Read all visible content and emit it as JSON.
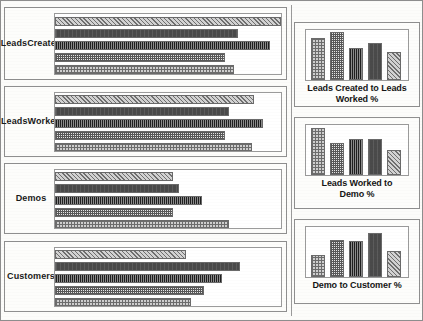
{
  "chart_data": [
    {
      "type": "bar",
      "orientation": "horizontal",
      "title": "Leads Created",
      "categories": [
        "Series 1",
        "Series 2",
        "Series 3",
        "Series 4",
        "Series 5"
      ],
      "values": [
        100,
        81,
        95,
        75,
        79
      ],
      "xlim": [
        0,
        100
      ],
      "grid": false,
      "legend": "none",
      "patterns": [
        "diagonal-hatch",
        "dark-solid",
        "vertical-pinstripe",
        "fine-checker",
        "coarse-checker"
      ]
    },
    {
      "type": "bar",
      "orientation": "horizontal",
      "title": "Leads Worked",
      "categories": [
        "Series 1",
        "Series 2",
        "Series 3",
        "Series 4",
        "Series 5"
      ],
      "values": [
        88,
        77,
        92,
        75,
        87
      ],
      "xlim": [
        0,
        100
      ],
      "grid": false,
      "legend": "none",
      "patterns": [
        "diagonal-hatch",
        "dark-solid",
        "vertical-pinstripe",
        "fine-checker",
        "coarse-checker"
      ]
    },
    {
      "type": "bar",
      "orientation": "horizontal",
      "title": "Demos",
      "categories": [
        "Series 1",
        "Series 2",
        "Series 3",
        "Series 4",
        "Series 5"
      ],
      "values": [
        52,
        55,
        65,
        52,
        77
      ],
      "xlim": [
        0,
        100
      ],
      "grid": false,
      "legend": "none",
      "patterns": [
        "diagonal-hatch",
        "dark-solid",
        "vertical-pinstripe",
        "fine-checker",
        "coarse-checker"
      ]
    },
    {
      "type": "bar",
      "orientation": "horizontal",
      "title": "Customers",
      "categories": [
        "Series 1",
        "Series 2",
        "Series 3",
        "Series 4",
        "Series 5"
      ],
      "values": [
        58,
        82,
        74,
        66,
        60
      ],
      "xlim": [
        0,
        100
      ],
      "grid": false,
      "legend": "none",
      "patterns": [
        "diagonal-hatch",
        "dark-solid",
        "vertical-pinstripe",
        "fine-checker",
        "coarse-checker"
      ]
    },
    {
      "type": "bar",
      "orientation": "vertical",
      "title": "Leads Created to Leads Worked %",
      "categories": [
        "Series 1",
        "Series 2",
        "Series 3",
        "Series 4",
        "Series 5"
      ],
      "values": [
        84,
        95,
        64,
        74,
        55
      ],
      "ylim": [
        0,
        100
      ],
      "grid": false,
      "legend": "none",
      "patterns": [
        "coarse-checker",
        "fine-checker",
        "vertical-pinstripe",
        "dark-solid",
        "diagonal-hatch"
      ]
    },
    {
      "type": "bar",
      "orientation": "vertical",
      "title": "Leads Worked to Demo %",
      "categories": [
        "Series 1",
        "Series 2",
        "Series 3",
        "Series 4",
        "Series 5"
      ],
      "values": [
        93,
        63,
        72,
        72,
        50
      ],
      "ylim": [
        0,
        100
      ],
      "grid": false,
      "legend": "none",
      "patterns": [
        "coarse-checker",
        "fine-checker",
        "vertical-pinstripe",
        "dark-solid",
        "diagonal-hatch"
      ]
    },
    {
      "type": "bar",
      "orientation": "vertical",
      "title": "Demo to Customer %",
      "categories": [
        "Series 1",
        "Series 2",
        "Series 3",
        "Series 4",
        "Series 5"
      ],
      "values": [
        44,
        74,
        72,
        88,
        52
      ],
      "ylim": [
        0,
        100
      ],
      "grid": false,
      "legend": "none",
      "patterns": [
        "coarse-checker",
        "fine-checker",
        "vertical-pinstripe",
        "dark-solid",
        "diagonal-hatch"
      ]
    }
  ],
  "funnel_panels": [
    {
      "label_line1": "Leads",
      "label_line2": "Created",
      "bars": [
        {
          "pattern": "p1",
          "length_pct": 100
        },
        {
          "pattern": "p2",
          "length_pct": 81
        },
        {
          "pattern": "p3",
          "length_pct": 95
        },
        {
          "pattern": "p4",
          "length_pct": 75
        },
        {
          "pattern": "p5",
          "length_pct": 79
        }
      ]
    },
    {
      "label_line1": "Leads",
      "label_line2": "Worked",
      "bars": [
        {
          "pattern": "p1",
          "length_pct": 88
        },
        {
          "pattern": "p2",
          "length_pct": 77
        },
        {
          "pattern": "p3",
          "length_pct": 92
        },
        {
          "pattern": "p4",
          "length_pct": 75
        },
        {
          "pattern": "p5",
          "length_pct": 87
        }
      ]
    },
    {
      "label_line1": "Demos",
      "label_line2": "",
      "bars": [
        {
          "pattern": "p1",
          "length_pct": 52
        },
        {
          "pattern": "p2",
          "length_pct": 55
        },
        {
          "pattern": "p3",
          "length_pct": 65
        },
        {
          "pattern": "p4",
          "length_pct": 52
        },
        {
          "pattern": "p5",
          "length_pct": 77
        }
      ]
    },
    {
      "label_line1": "Customers",
      "label_line2": "",
      "bars": [
        {
          "pattern": "p1",
          "length_pct": 58
        },
        {
          "pattern": "p2",
          "length_pct": 82
        },
        {
          "pattern": "p3",
          "length_pct": 74
        },
        {
          "pattern": "p4",
          "length_pct": 66
        },
        {
          "pattern": "p5",
          "length_pct": 60
        }
      ]
    }
  ],
  "ratio_panels": [
    {
      "caption_line1": "Leads Created to Leads",
      "caption_line2": "Worked %",
      "bars": [
        {
          "pattern": "p5",
          "height_pct": 84
        },
        {
          "pattern": "p4",
          "height_pct": 95
        },
        {
          "pattern": "p3",
          "height_pct": 64
        },
        {
          "pattern": "p2",
          "height_pct": 74
        },
        {
          "pattern": "p1",
          "height_pct": 55
        }
      ]
    },
    {
      "caption_line1": "Leads Worked to",
      "caption_line2": "Demo %",
      "bars": [
        {
          "pattern": "p5",
          "height_pct": 93
        },
        {
          "pattern": "p4",
          "height_pct": 63
        },
        {
          "pattern": "p3",
          "height_pct": 72
        },
        {
          "pattern": "p2",
          "height_pct": 72
        },
        {
          "pattern": "p1",
          "height_pct": 50
        }
      ]
    },
    {
      "caption_line1": "Demo to Customer %",
      "caption_line2": "",
      "bars": [
        {
          "pattern": "p5",
          "height_pct": 44
        },
        {
          "pattern": "p4",
          "height_pct": 74
        },
        {
          "pattern": "p3",
          "height_pct": 72
        },
        {
          "pattern": "p2",
          "height_pct": 88
        },
        {
          "pattern": "p1",
          "height_pct": 52
        }
      ]
    }
  ]
}
